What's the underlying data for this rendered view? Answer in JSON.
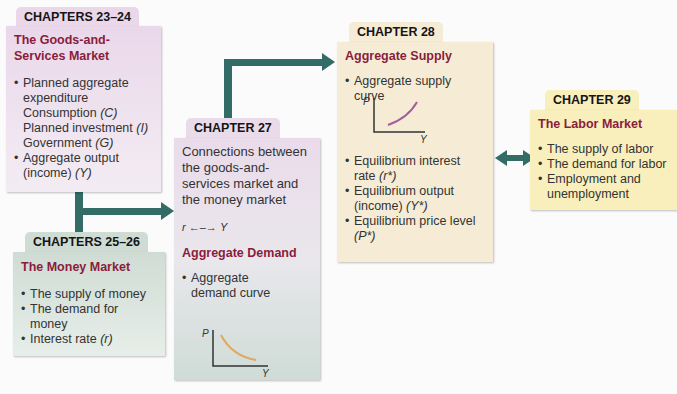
{
  "colors": {
    "connector": "#336b66",
    "heading": "#8a1c3c",
    "box_goods": "#ead8ea",
    "box_money": "#cfdcd4",
    "box_ch27_top": "#eadbea",
    "box_ch27_bottom": "#cfdcd6",
    "box_supply": "#f6ecd6",
    "box_labor": "#f9efbc",
    "ad_curve": "#e0a860",
    "as_curve": "#a0609a"
  },
  "boxes": {
    "goods": {
      "tab": "CHAPTERS 23–24",
      "heading": "The Goods-and-Services Market",
      "items": [
        {
          "text": "Planned aggregate expenditure"
        },
        {
          "text": "Aggregate output (income) ",
          "sym": "(Y)"
        }
      ],
      "subitems": [
        {
          "text": "Consumption ",
          "sym": "(C)"
        },
        {
          "text": "Planned investment ",
          "sym": "(I)"
        },
        {
          "text": "Government ",
          "sym": "(G)"
        }
      ]
    },
    "money": {
      "tab": "CHAPTERS 25–26",
      "heading": "The Money Market",
      "items": [
        {
          "text": "The supply of money"
        },
        {
          "text": "The demand for money"
        },
        {
          "text": "Interest rate ",
          "sym": "(r)"
        }
      ]
    },
    "ch27": {
      "tab": "CHAPTER 27",
      "intro": "Connections between the goods-and-services market and the money market",
      "relation": {
        "left": "r",
        "arrow": "←–→",
        "right": "Y"
      },
      "heading": "Aggregate Demand",
      "items": [
        {
          "text": "Aggregate demand curve"
        }
      ],
      "graph": {
        "y_label": "P",
        "x_label": "Y",
        "curve": "downward-sloping"
      }
    },
    "ch28": {
      "tab": "CHAPTER 28",
      "heading": "Aggregate Supply",
      "items_top": [
        {
          "text": "Aggregate supply curve"
        }
      ],
      "graph": {
        "y_label": "P",
        "x_label": "Y",
        "curve": "upward-sloping"
      },
      "items": [
        {
          "text": "Equilibrium interest rate ",
          "sym": "(r*)"
        },
        {
          "text": "Equilibrium output (income) ",
          "sym": "(Y*)"
        },
        {
          "text": "Equilibrium price level ",
          "sym": "(P*)"
        }
      ]
    },
    "labor": {
      "tab": "CHAPTER 29",
      "heading": "The Labor Market",
      "items": [
        {
          "text": "The supply of labor"
        },
        {
          "text": "The demand for labor"
        },
        {
          "text": "Employment and unemployment"
        }
      ]
    }
  }
}
